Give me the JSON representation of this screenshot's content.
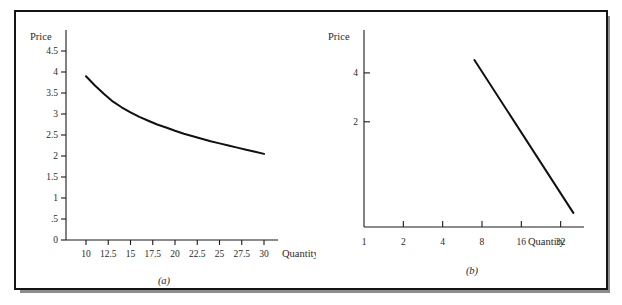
{
  "figure": {
    "background_color": "#ffffff",
    "frame_color": "#151515",
    "shadow_color": "#8d8d8d",
    "line_color": "#111111",
    "text_color": "#2a2a2a"
  },
  "chart_data": [
    {
      "type": "line",
      "panel_label": "(a)",
      "title": "",
      "xlabel": "Quantity",
      "ylabel": "Price",
      "scale": "linear-linear",
      "grid": false,
      "legend": "none",
      "xlim": [
        10,
        30
      ],
      "ylim": [
        0,
        4.5
      ],
      "xticks": [
        10,
        12.5,
        15,
        17.5,
        20,
        22.5,
        25,
        27.5,
        30
      ],
      "xticklabels": [
        "10",
        "12.5",
        "15",
        "17.5",
        "20",
        "22.5",
        "25",
        "27.5",
        "30"
      ],
      "yticks": [
        0,
        0.5,
        1,
        1.5,
        2,
        2.5,
        3,
        3.5,
        4,
        4.5
      ],
      "yticklabels": [
        "0",
        ".5",
        "1",
        "1.5",
        "2",
        "2.5",
        "3",
        "3.5",
        "4",
        "4.5"
      ],
      "series": [
        {
          "name": "demand",
          "x": [
            10,
            11,
            12,
            13,
            14,
            15,
            16,
            17,
            18,
            19,
            20,
            21,
            22,
            23,
            24,
            25,
            26,
            27,
            28,
            29,
            30
          ],
          "y": [
            3.9,
            3.68,
            3.48,
            3.3,
            3.16,
            3.04,
            2.93,
            2.84,
            2.75,
            2.68,
            2.6,
            2.53,
            2.47,
            2.41,
            2.35,
            2.3,
            2.25,
            2.2,
            2.15,
            2.1,
            2.05
          ]
        }
      ]
    },
    {
      "type": "line",
      "panel_label": "(b)",
      "title": "",
      "xlabel": "Quantity",
      "ylabel": "Price",
      "scale": "log-log",
      "grid": false,
      "legend": "none",
      "xlim": [
        1,
        45
      ],
      "ylim": [
        0.45,
        6.2
      ],
      "xticks": [
        1,
        2,
        4,
        8,
        16,
        32
      ],
      "xticklabels": [
        "1",
        "2",
        "4",
        "8",
        "16",
        "32"
      ],
      "yticks": [
        2,
        4
      ],
      "yticklabels": [
        "2",
        "4"
      ],
      "series": [
        {
          "name": "demand-log",
          "x": [
            7,
            40
          ],
          "y": [
            4.8,
            0.55
          ]
        }
      ]
    }
  ]
}
